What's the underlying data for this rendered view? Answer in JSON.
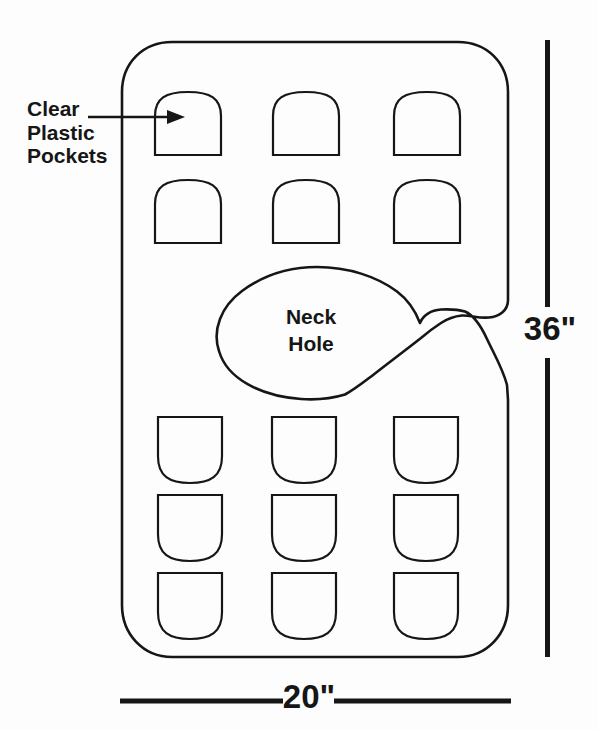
{
  "figure": {
    "type": "apron-pocket-organizer-diagram",
    "pocket_label": {
      "lines": [
        "Clear",
        "Plastic",
        "Pockets"
      ]
    },
    "neck_label": {
      "lines": [
        "Neck",
        "Hole"
      ]
    },
    "dimensions": {
      "height": "36\"",
      "width": "20\""
    },
    "pocket_grids": [
      {
        "name": "upper-pocket",
        "shape": "dome",
        "cols_x": [
          155,
          273,
          394
        ],
        "rows_y": [
          92,
          180
        ],
        "w": 66,
        "h": 63
      },
      {
        "name": "lower-pocket",
        "shape": "shield",
        "cols_x": [
          158,
          272,
          394
        ],
        "rows_y": [
          417,
          495,
          573
        ],
        "w": 64,
        "h": 66
      }
    ],
    "colors": {
      "line": "#161616",
      "background": "#ffffff"
    }
  }
}
